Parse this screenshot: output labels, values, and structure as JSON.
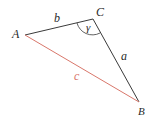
{
  "diagram": {
    "type": "triangle",
    "vertices": [
      {
        "name": "A",
        "label": "A",
        "x": 25,
        "y": 35
      },
      {
        "name": "C",
        "label": "C",
        "x": 93,
        "y": 19
      },
      {
        "name": "B",
        "label": "B",
        "x": 139,
        "y": 102
      }
    ],
    "sides": [
      {
        "name": "b",
        "label": "b",
        "from": "A",
        "to": "C",
        "color": "#3a3a3a"
      },
      {
        "name": "a",
        "label": "a",
        "from": "C",
        "to": "B",
        "color": "#3a3a3a"
      },
      {
        "name": "c",
        "label": "c",
        "from": "A",
        "to": "B",
        "color": "#d9776b"
      }
    ],
    "angle": {
      "label": "γ",
      "vertex": "C"
    }
  }
}
